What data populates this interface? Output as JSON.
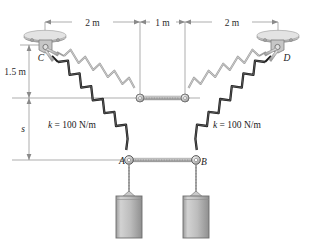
{
  "figure": {
    "background_color": "#ffffff"
  },
  "dimensions": {
    "horizontal": [
      {
        "label": "2 m",
        "x_start": 45,
        "x_end": 140
      },
      {
        "label": "1 m",
        "x_start": 140,
        "x_end": 185
      },
      {
        "label": "2 m",
        "x_start": 185,
        "x_end": 278
      }
    ],
    "vertical": [
      {
        "label": "1.5 m",
        "y_start": 45,
        "y_end": 98
      },
      {
        "label": "s",
        "y_start": 98,
        "y_end": 160
      }
    ]
  },
  "supports": [
    {
      "name": "C",
      "label": "C",
      "x": 45,
      "y": 45
    },
    {
      "name": "D",
      "label": "D",
      "x": 278,
      "y": 45
    }
  ],
  "joints": [
    {
      "name": "A",
      "label": "A",
      "x": 129,
      "y": 160
    },
    {
      "name": "B",
      "label": "B",
      "x": 196,
      "y": 160
    },
    {
      "name": "E",
      "label": "",
      "x": 140,
      "y": 98
    },
    {
      "name": "F",
      "label": "",
      "x": 185,
      "y": 98
    }
  ],
  "springs": [
    {
      "name": "spring-C-to-center",
      "k_label": "",
      "shade": "light"
    },
    {
      "name": "spring-C-to-A",
      "k_label": "k = 100 N/m",
      "shade": "dark"
    },
    {
      "name": "spring-D-to-center",
      "k_label": "",
      "shade": "light"
    },
    {
      "name": "spring-D-to-B",
      "k_label": "k = 100 N/m",
      "shade": "dark"
    }
  ],
  "spring_labels": {
    "left": {
      "k": "k",
      "eq": " = 100 N/m",
      "x": 48,
      "y": 125
    },
    "right": {
      "k": "k",
      "eq": " = 100 N/m",
      "x": 213,
      "y": 125
    }
  },
  "blocks": [
    {
      "name": "block-left",
      "x": 129,
      "y": 196,
      "width": 26,
      "height": 42
    },
    {
      "name": "block-right",
      "x": 196,
      "y": 196,
      "width": 26,
      "height": 42
    }
  ],
  "colors": {
    "line": "#4a4a4a",
    "dim_line": "#8a8a8a",
    "spring_dark": "#1c1c1c",
    "spring_light": "#a9a9a9",
    "block_fill": "#b8b8b8",
    "block_edge": "#6e6e6e",
    "support_fill": "#cfcfcf",
    "support_edge": "#777777",
    "text": "#1a1a1a"
  }
}
